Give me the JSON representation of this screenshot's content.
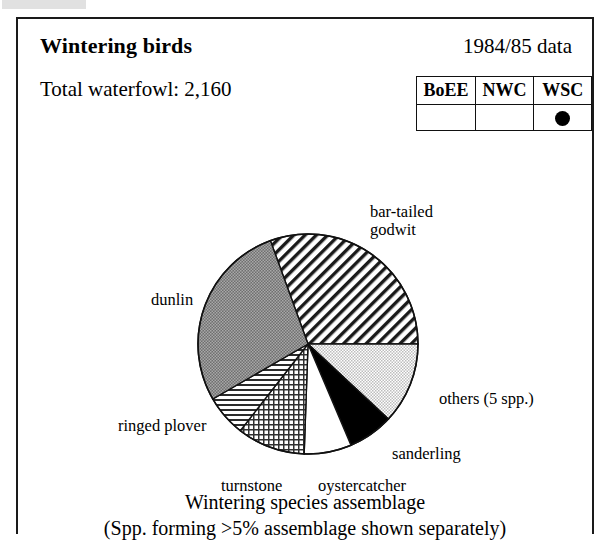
{
  "panel": {
    "title": "Wintering birds",
    "year_label": "1984/85 data",
    "total_label": "Total waterfowl: 2,160"
  },
  "survey_table": {
    "headers": [
      "BoEE",
      "NWC",
      "WSC"
    ],
    "values": [
      "",
      "",
      "●"
    ],
    "marked_column": "WSC",
    "marker_icon": "filled-circle-icon"
  },
  "caption": {
    "line1": "Wintering species assemblage",
    "line2": "(Spp. forming >5% assemblage shown separately)"
  },
  "chart_data": {
    "type": "pie",
    "title": "Wintering species assemblage",
    "subtitle": "(Spp. forming >5% assemblage shown separately)",
    "total_waterfowl": 2160,
    "start_angle_deg": -20,
    "direction": "clockwise",
    "legend": "none (direct labels)",
    "categories": [
      "bar-tailed godwit",
      "others (5 spp.)",
      "sanderling",
      "oystercatcher",
      "turnstone",
      "ringed plover",
      "dunlin"
    ],
    "values": [
      30.6,
      11.9,
      6.7,
      6.9,
      10.0,
      6.1,
      27.8
    ],
    "unit": "percent of assemblage",
    "slices": [
      {
        "label": "bar-tailed godwit",
        "value": 30.6,
        "start_deg": -20,
        "end_deg": 90,
        "fill": "diagonal-hatch"
      },
      {
        "label": "others (5 spp.)",
        "value": 11.9,
        "start_deg": 90,
        "end_deg": 133,
        "fill": "light-dots"
      },
      {
        "label": "sanderling",
        "value": 6.7,
        "start_deg": 133,
        "end_deg": 157,
        "fill": "solid-black"
      },
      {
        "label": "oystercatcher",
        "value": 6.9,
        "start_deg": 157,
        "end_deg": 182,
        "fill": "white"
      },
      {
        "label": "turnstone",
        "value": 10.0,
        "start_deg": 182,
        "end_deg": 218,
        "fill": "fine-crosshatch"
      },
      {
        "label": "ringed plover",
        "value": 6.1,
        "start_deg": 218,
        "end_deg": 240,
        "fill": "horizontal-lines"
      },
      {
        "label": "dunlin",
        "value": 27.8,
        "start_deg": 240,
        "end_deg": 340,
        "fill": "dark-dots"
      }
    ]
  },
  "labels": {
    "godwit": "bar-tailed\ngodwit",
    "others": "others (5 spp.)",
    "sanderling": "sanderling",
    "oystercatcher": "oystercatcher",
    "turnstone": "turnstone",
    "ringed_plover": "ringed plover",
    "dunlin": "dunlin"
  },
  "colors": {
    "ink": "#000000",
    "border": "#1a1a1a",
    "dark_fill": "#8d8d8d",
    "light_fill": "#cfcfcf",
    "paper": "#ffffff"
  }
}
